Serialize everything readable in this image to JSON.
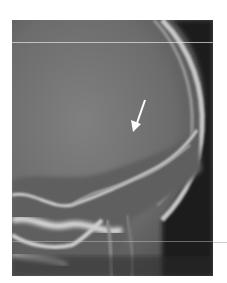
{
  "image": {
    "subject": "lateral skull radiograph",
    "modality": "X-ray",
    "annotation": {
      "type": "arrow",
      "color": "#ffffff",
      "direction": "down-left"
    }
  },
  "colors": {
    "background": "#ffffff",
    "film_mid": "#6f6f6f",
    "bone": "#e0e0e0",
    "dark_region": "#141414"
  }
}
